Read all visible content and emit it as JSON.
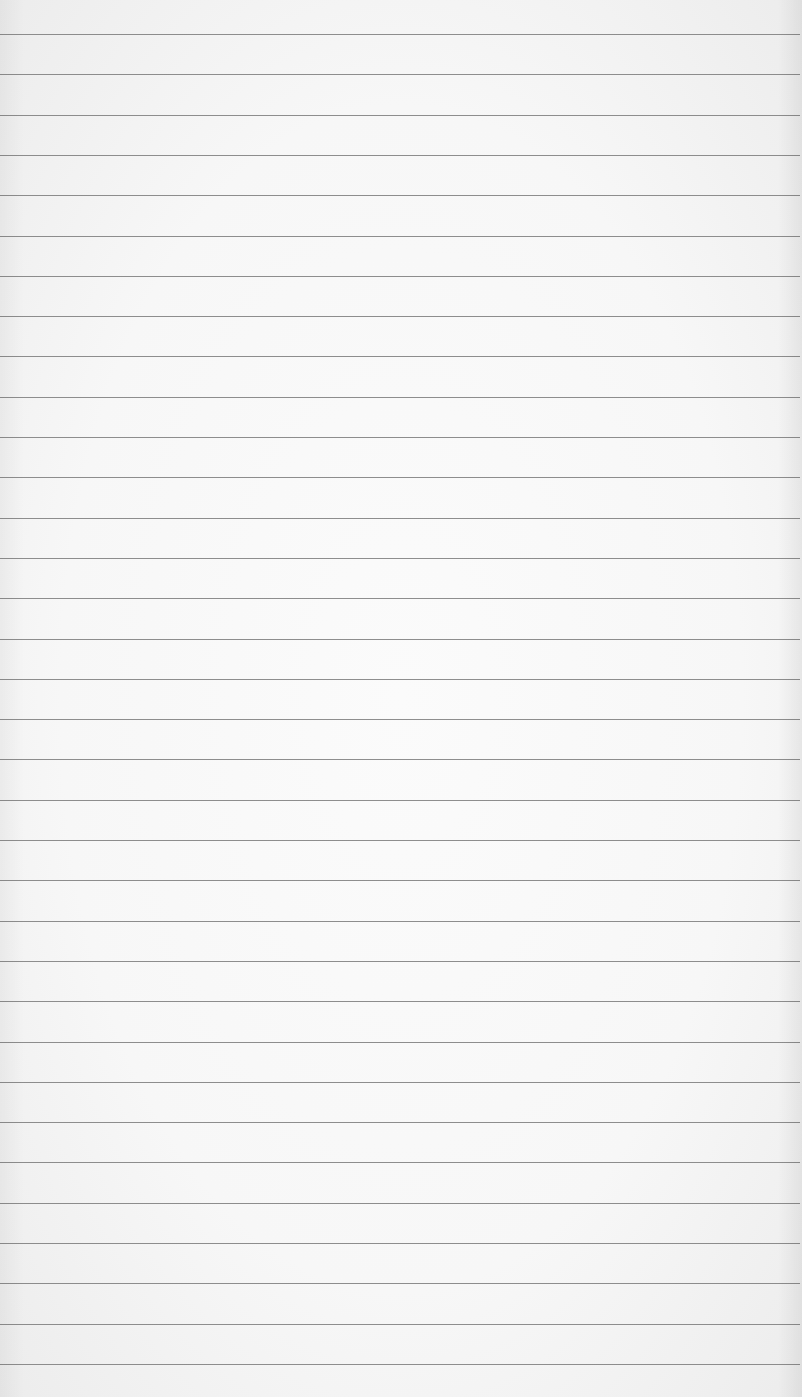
{
  "paper": {
    "kind": "ruled-notebook-page",
    "background_color": "#f7f7f7",
    "rule_color": "#7a7a7a",
    "rule_count": 34,
    "first_rule_y": 34,
    "rule_spacing": 40.3,
    "text": ""
  }
}
